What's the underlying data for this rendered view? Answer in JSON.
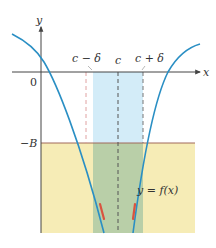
{
  "diagram": {
    "axes": {
      "x_label": "x",
      "y_label": "y",
      "origin_label": "0"
    },
    "labels": {
      "c_minus_delta": "c − δ",
      "c": "c",
      "c_plus_delta": "c + δ",
      "neg_B": "−B",
      "function": "y = f(x)"
    },
    "regions": {
      "delta_band": "interval (c − δ, c + δ)",
      "below_neg_B": "y < −B"
    },
    "colors": {
      "curve": "#2a8fc4",
      "band": "#d3ecf8",
      "yellow": "#f6ecb6",
      "overlap": "#b9cfa8",
      "neg_B_line": "#a0685a",
      "highlight": "#d9533f",
      "axis": "#444444",
      "dash_dark": "#555555",
      "dash_pink": "#e0a2a2"
    }
  }
}
